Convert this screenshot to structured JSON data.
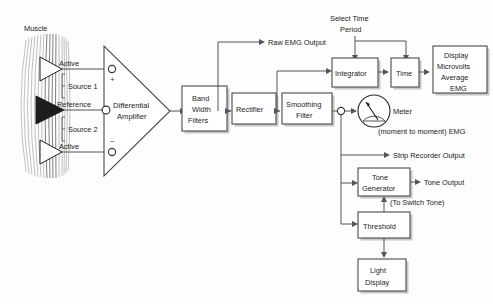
{
  "diagram": {
    "background_color": "#fdfdfd",
    "line_color": "#555555",
    "box_fill": "#ffffff",
    "box_stroke": "#4a4a4a",
    "text_color": "#1b1b1b"
  },
  "source": {
    "muscle_label": "Muscle",
    "electrodes": [
      {
        "label": "Active",
        "type": "open-triangle"
      },
      {
        "label": "Reference",
        "type": "filled-triangle"
      },
      {
        "label": "Active",
        "type": "open-triangle"
      }
    ],
    "sources": [
      {
        "label": "Source 1"
      },
      {
        "label": "Source 2"
      }
    ]
  },
  "amplifier": {
    "label_line1": "Differential",
    "label_line2": "Amplifier",
    "terminals": [
      {
        "name": "positive",
        "symbol": "+"
      },
      {
        "name": "reference",
        "symbol": ""
      },
      {
        "name": "negative",
        "symbol": "−"
      }
    ]
  },
  "blocks": [
    {
      "id": "bandwidth",
      "lines": [
        "Band",
        "Width",
        "Filters"
      ]
    },
    {
      "id": "rectifier",
      "lines": [
        "Rectifier"
      ]
    },
    {
      "id": "smoothing",
      "lines": [
        "Smoothing",
        "Filter"
      ]
    },
    {
      "id": "integrator",
      "lines": [
        "Integrator"
      ]
    },
    {
      "id": "time",
      "lines": [
        "Time"
      ]
    },
    {
      "id": "display",
      "lines": [
        "Display",
        "Microvolts",
        "Average",
        "EMG"
      ]
    },
    {
      "id": "tone_generator",
      "lines": [
        "Tone",
        "Generator"
      ]
    },
    {
      "id": "threshold",
      "lines": [
        "Threshold"
      ]
    },
    {
      "id": "light_display",
      "lines": [
        "Light",
        "Display"
      ]
    }
  ],
  "labels": {
    "raw_emg_output": "Raw EMG Output",
    "select_time_period_line1": "Select Time",
    "select_time_period_line2": "Period",
    "meter": "Meter",
    "moment_to_moment": "(moment to moment) EMG",
    "strip_recorder_output": "Strip Recorder Output",
    "tone_output": "Tone Output",
    "to_switch_tone": "(To Switch Tone)"
  }
}
